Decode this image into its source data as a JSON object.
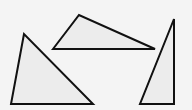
{
  "diagram": {
    "background": "#f4f4f4",
    "fill": "#ececec",
    "stroke": "#111111",
    "stroke_width": 2,
    "triangles": [
      {
        "name": "left-triangle",
        "points": "24,34 11,104 93,104"
      },
      {
        "name": "top-triangle",
        "points": "53,49 79,15 155,49"
      },
      {
        "name": "right-triangle",
        "points": "174,19 140,104 174,104"
      }
    ]
  }
}
